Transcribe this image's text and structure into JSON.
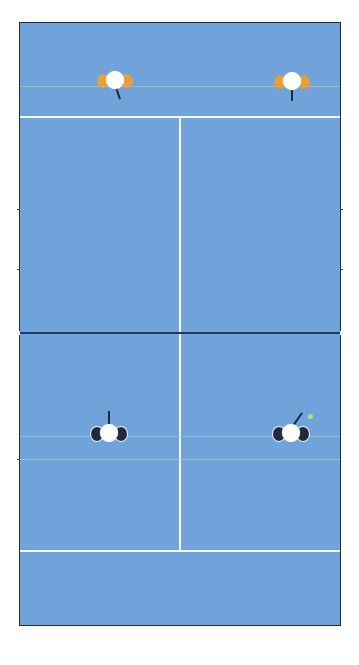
{
  "game": {
    "type": "tennis-doubles",
    "view": "top-down"
  },
  "colors": {
    "court": "#6fa3d9",
    "lines": "#f4f9ff",
    "net": "#213a60",
    "border": "#1e2a44",
    "team_top": "#e6a03c",
    "team_bottom": "#1f2a3f",
    "ball": "#b7e07a"
  },
  "players": [
    {
      "id": "top-left",
      "team": "top",
      "x": 94,
      "y": 66,
      "racket": "down-right"
    },
    {
      "id": "top-right",
      "team": "top",
      "x": 271,
      "y": 66,
      "racket": "down"
    },
    {
      "id": "bottom-left",
      "team": "bottom",
      "x": 89,
      "y": 416,
      "racket": "up"
    },
    {
      "id": "bottom-right",
      "team": "bottom",
      "x": 269,
      "y": 416,
      "racket": "up-right"
    }
  ],
  "ball": {
    "x": 309,
    "y": 415
  }
}
